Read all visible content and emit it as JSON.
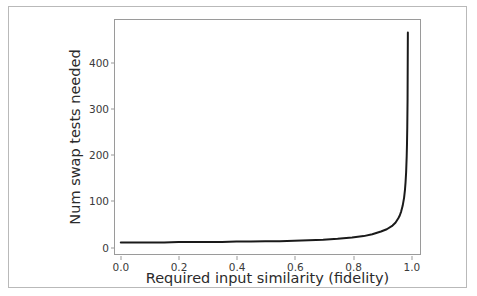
{
  "chart_data": {
    "type": "line",
    "title": "",
    "xlabel": "Required input similarity (fidelity)",
    "ylabel": "Num swap tests needed",
    "xlim": [
      -0.02,
      1.035
    ],
    "ylim": [
      -18,
      492
    ],
    "xticks": [
      "0.0",
      "0.2",
      "0.4",
      "0.6",
      "0.8",
      "1.0"
    ],
    "xtick_values": [
      0.0,
      0.2,
      0.4,
      0.6,
      0.8,
      1.0
    ],
    "yticks": [
      "0",
      "100",
      "200",
      "300",
      "400"
    ],
    "ytick_values": [
      0,
      100,
      200,
      300,
      400
    ],
    "grid": false,
    "legend": null,
    "line_color": "#1a1a1a",
    "line_width": 2.0,
    "series": [
      {
        "name": "swap tests needed",
        "x": [
          0.0,
          0.05,
          0.1,
          0.15,
          0.2,
          0.25,
          0.3,
          0.35,
          0.4,
          0.45,
          0.5,
          0.55,
          0.6,
          0.65,
          0.7,
          0.75,
          0.8,
          0.84,
          0.87,
          0.9,
          0.92,
          0.94,
          0.95,
          0.96,
          0.965,
          0.97,
          0.975,
          0.98,
          0.983,
          0.985,
          0.987,
          0.989,
          0.99,
          0.991,
          0.992,
          0.993
        ],
        "y": [
          7,
          7,
          7,
          7,
          8,
          8,
          8,
          8,
          9,
          9,
          10,
          10,
          11,
          12,
          13,
          15,
          18,
          21,
          25,
          31,
          36,
          44,
          50,
          60,
          66,
          75,
          87,
          105,
          122,
          138,
          160,
          195,
          222,
          260,
          320,
          465
        ]
      }
    ]
  },
  "figure": {
    "border_color": "#b9b9b9",
    "axes_color": "#9a9a9a",
    "background": "#ffffff"
  }
}
